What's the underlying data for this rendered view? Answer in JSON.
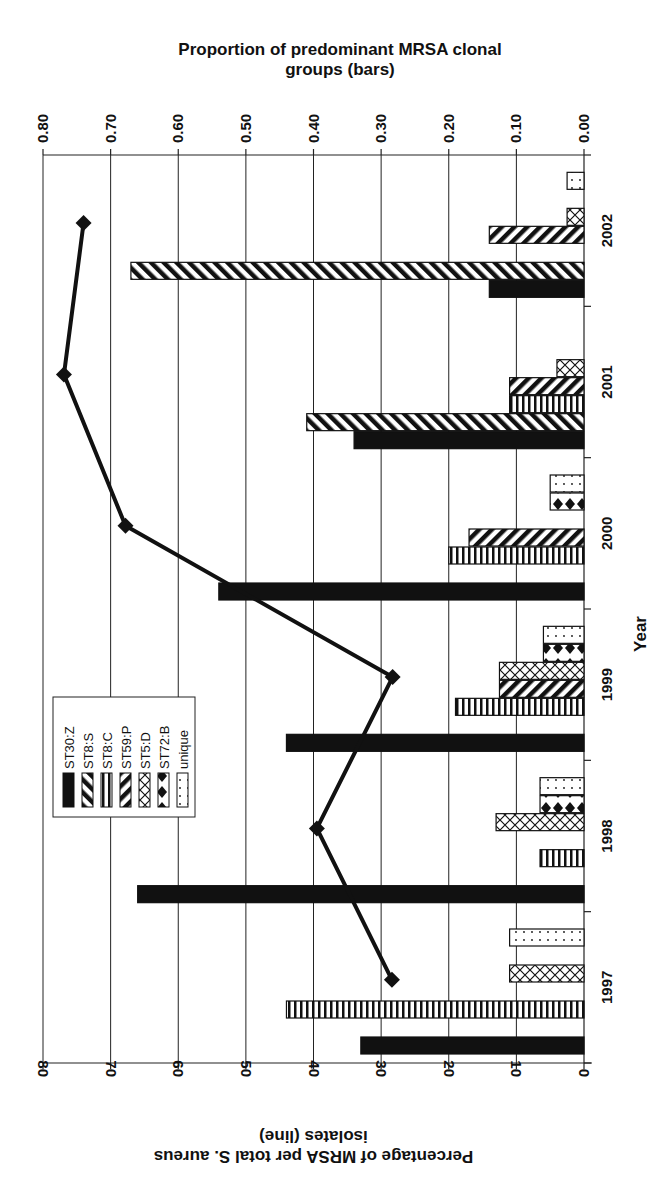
{
  "chart_data": {
    "type": "bar",
    "orientation": "chart image rotated 90 degrees; categories on right edge, values horizontal",
    "title_bars_axis": "Proportion of predominant MRSA clonal groups (bars)",
    "title_line_axis": "Percentage of MRSA per total S. aureus isolates (line)",
    "xlabel": "Year",
    "categories": [
      "1997",
      "1998",
      "1999",
      "2000",
      "2001",
      "2002"
    ],
    "bar_axis": {
      "range": [
        0,
        0.8
      ],
      "ticks": [
        "0.80",
        "0.70",
        "0.60",
        "0.50",
        "0.40",
        "0.30",
        "0.20",
        "0.10",
        "0.00"
      ]
    },
    "line_axis": {
      "range": [
        0,
        80
      ],
      "ticks": [
        "80",
        "70",
        "60",
        "50",
        "40",
        "30",
        "20",
        "10",
        "0"
      ]
    },
    "grid": true,
    "legend_position": "left-middle",
    "series": [
      {
        "name": "ST30:Z",
        "pattern": "solid",
        "values": [
          0.33,
          0.66,
          0.44,
          0.54,
          0.34,
          0.14
        ]
      },
      {
        "name": "ST8:S",
        "pattern": "diag-back",
        "values": [
          0,
          0,
          0,
          0,
          0.41,
          0.67
        ]
      },
      {
        "name": "ST8:C",
        "pattern": "vertical",
        "values": [
          0.44,
          0.065,
          0.19,
          0.2,
          0.11,
          0
        ]
      },
      {
        "name": "ST59:P",
        "pattern": "diag-fwd",
        "values": [
          0,
          0,
          0.125,
          0.17,
          0.11,
          0.14
        ]
      },
      {
        "name": "ST5:D",
        "pattern": "cross",
        "values": [
          0.11,
          0.13,
          0.125,
          0,
          0.04,
          0.025
        ]
      },
      {
        "name": "ST72:B",
        "pattern": "diamond",
        "values": [
          0,
          0.065,
          0.06,
          0.05,
          0,
          0
        ]
      },
      {
        "name": "unique",
        "pattern": "dots",
        "values": [
          0.11,
          0.065,
          0.06,
          0.05,
          0,
          0.025
        ]
      }
    ],
    "line_series": {
      "name": "Percentage of MRSA per total S. aureus isolates",
      "values": [
        28.4,
        39.5,
        28.3,
        67.8,
        76.9,
        74.0
      ]
    }
  }
}
